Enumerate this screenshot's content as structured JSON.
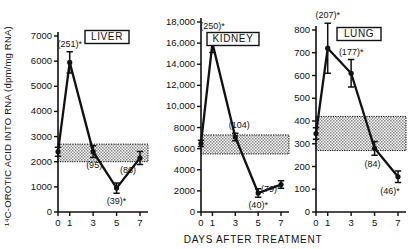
{
  "figure": {
    "ylabel": "¹⁴C-OROTIC ACID INTO RNA (dpm/mg RNA)",
    "xlabel": "DAYS AFTER TREATMENT"
  },
  "chart_data": [
    {
      "type": "line",
      "title": "LIVER",
      "xlabel": "DAYS AFTER TREATMENT",
      "ylabel": "14C-OROTIC ACID INTO RNA (dpm/mg RNA)",
      "x": [
        0,
        1,
        3,
        5,
        7
      ],
      "xticklabels": [
        "0",
        "1",
        "3",
        "5",
        "7"
      ],
      "values": [
        2400,
        5950,
        2400,
        950,
        2150
      ],
      "errors": [
        180,
        420,
        230,
        200,
        260
      ],
      "ylim": [
        0,
        7000
      ],
      "yticks": [
        0,
        1000,
        2000,
        3000,
        4000,
        5000,
        6000,
        7000
      ],
      "yticklabels": [
        "0",
        "1000",
        "2000",
        "3000",
        "4000",
        "5000",
        "6000",
        "7000"
      ],
      "control_band": [
        2000,
        2700
      ],
      "point_labels": [
        "",
        "(251)*",
        "(95)",
        "(39)*",
        "(86)"
      ],
      "grid": false,
      "legend": "none"
    },
    {
      "type": "line",
      "title": "KIDNEY",
      "xlabel": "DAYS AFTER TREATMENT",
      "ylabel": "14C-OROTIC ACID INTO RNA (dpm/mg RNA)",
      "x": [
        0,
        1,
        3,
        5,
        7
      ],
      "xticklabels": [
        "0",
        "1",
        "3",
        "5",
        "7"
      ],
      "values": [
        6500,
        16000,
        7100,
        1800,
        2600
      ],
      "errors": [
        300,
        900,
        350,
        400,
        350
      ],
      "ylim": [
        0,
        18000
      ],
      "yticks": [
        0,
        2000,
        4000,
        6000,
        8000,
        10000,
        12000,
        14000,
        16000,
        18000
      ],
      "yticklabels": [
        "0",
        "2000",
        "4000",
        "6000",
        "8000",
        "10,000",
        "12,000",
        "14,000",
        "16,000",
        "18,000"
      ],
      "control_band": [
        5500,
        7300
      ],
      "point_labels": [
        "",
        "(250)*",
        "(104)",
        "(40)*",
        "(79)"
      ],
      "grid": false,
      "legend": "none"
    },
    {
      "type": "line",
      "title": "LUNG",
      "xlabel": "DAYS AFTER TREATMENT",
      "ylabel": "14C-OROTIC ACID INTO RNA (dpm/mg RNA)",
      "x": [
        0,
        1,
        3,
        5,
        7
      ],
      "xticklabels": [
        "0",
        "1",
        "3",
        "5",
        "7"
      ],
      "values": [
        345,
        720,
        610,
        280,
        155
      ],
      "errors": [
        25,
        110,
        60,
        30,
        25
      ],
      "ylim": [
        0,
        800
      ],
      "yticks": [
        0,
        100,
        200,
        300,
        400,
        500,
        600,
        700,
        800
      ],
      "yticklabels": [
        "0",
        "100",
        "200",
        "300",
        "400",
        "500",
        "600",
        "700",
        "800"
      ],
      "control_band": [
        270,
        420
      ],
      "point_labels": [
        "",
        "(207)*",
        "(177)*",
        "(84)",
        "(46)*"
      ],
      "grid": false,
      "legend": "none"
    }
  ]
}
